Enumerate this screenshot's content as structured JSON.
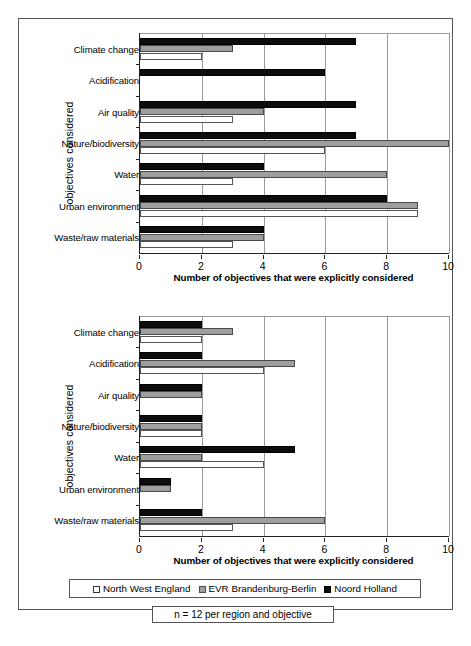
{
  "legend": {
    "items": [
      {
        "label": "North West England",
        "swatch": "white",
        "color": "#ffffff"
      },
      {
        "label": "EVR Brandenburg-Berlin",
        "swatch": "gray",
        "color": "#9e9e9e"
      },
      {
        "label": "Noord Holland",
        "swatch": "black",
        "color": "#0d0d0d"
      }
    ]
  },
  "note": "n = 12 per region and objective",
  "chart_data": [
    {
      "type": "bar",
      "orientation": "horizontal",
      "panel": "top",
      "title": "",
      "xlabel": "Number of objectives that were explicitly considered",
      "ylabel": "objectives considered",
      "categories": [
        "Climate change",
        "Acidification",
        "Air quality",
        "Nature/biodiversity",
        "Water",
        "Urban environment",
        "Waste/raw materials"
      ],
      "series": [
        {
          "name": "Noord Holland",
          "color": "#0d0d0d",
          "values": [
            7,
            6,
            7,
            7,
            4,
            8,
            4
          ]
        },
        {
          "name": "EVR Brandenburg-Berlin",
          "color": "#9e9e9e",
          "values": [
            3,
            0,
            4,
            10,
            8,
            9,
            4
          ]
        },
        {
          "name": "North West England",
          "color": "#ffffff",
          "values": [
            2,
            0,
            3,
            6,
            3,
            9,
            3
          ]
        }
      ],
      "xlim": [
        0,
        10
      ],
      "xticks": [
        0,
        2,
        4,
        6,
        8,
        10
      ],
      "grid": true,
      "legend_position": "bottom"
    },
    {
      "type": "bar",
      "orientation": "horizontal",
      "panel": "bottom",
      "title": "",
      "xlabel": "Number of objectives that were explicitly considered",
      "ylabel": "objectives considered",
      "categories": [
        "Climate change",
        "Acidification",
        "Air quality",
        "Nature/biodiversity",
        "Water",
        "Urban environment",
        "Waste/raw materials"
      ],
      "series": [
        {
          "name": "Noord Holland",
          "color": "#0d0d0d",
          "values": [
            2,
            2,
            2,
            2,
            5,
            1,
            2
          ]
        },
        {
          "name": "EVR Brandenburg-Berlin",
          "color": "#9e9e9e",
          "values": [
            3,
            5,
            2,
            2,
            2,
            1,
            6
          ]
        },
        {
          "name": "North West England",
          "color": "#ffffff",
          "values": [
            2,
            4,
            0,
            2,
            4,
            0,
            3
          ]
        }
      ],
      "xlim": [
        0,
        10
      ],
      "xticks": [
        0,
        2,
        4,
        6,
        8,
        10
      ],
      "grid": true,
      "legend_position": "bottom"
    }
  ]
}
